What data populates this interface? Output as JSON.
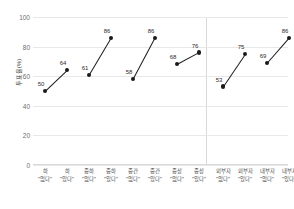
{
  "chart_data": {
    "type": "line",
    "title": "",
    "xlabel": "",
    "ylabel": "투표율(%)",
    "ylim": [
      0,
      100
    ],
    "yticks": [
      0,
      20,
      40,
      60,
      80,
      100
    ],
    "grid": true,
    "legend": "none",
    "categories": [
      "하 \"없다\"",
      "하 \"있다\"",
      "중하 \"없다\"",
      "중하 \"있다\"",
      "중간 \"없다\"",
      "중간 \"있다\"",
      "중상 \"없다\"",
      "중상 \"있다\"",
      "외부자 \"없다\"",
      "외부자 \"있다\"",
      "내부자 \"없다\"",
      "내부자 \"있다\""
    ],
    "category_lines": [
      [
        "하",
        "\"없다\""
      ],
      [
        "하",
        "\"있다\""
      ],
      [
        "중하",
        "\"없다\""
      ],
      [
        "중하",
        "\"있다\""
      ],
      [
        "중간",
        "\"없다\""
      ],
      [
        "중간",
        "\"있다\""
      ],
      [
        "중상",
        "\"없다\""
      ],
      [
        "중상",
        "\"있다\""
      ],
      [
        "외부자",
        "\"없다\""
      ],
      [
        "외부자",
        "\"있다\""
      ],
      [
        "내부자",
        "\"없다\""
      ],
      [
        "내부자",
        "\"있다\""
      ]
    ],
    "values": [
      50,
      64,
      61,
      86,
      58,
      86,
      68,
      76,
      53,
      75,
      69,
      86
    ],
    "point_labels": [
      "50",
      "64",
      "61",
      "86",
      "58",
      "86",
      "68",
      "76",
      "53",
      "75",
      "69",
      "86"
    ],
    "pairs": [
      {
        "name": "하",
        "no": 50,
        "yes": 64
      },
      {
        "name": "중하",
        "no": 61,
        "yes": 86
      },
      {
        "name": "중간",
        "no": 58,
        "yes": 86
      },
      {
        "name": "중상",
        "no": 68,
        "yes": 76
      },
      {
        "name": "외부자",
        "no": 53,
        "yes": 75
      },
      {
        "name": "내부자",
        "no": 69,
        "yes": 86
      }
    ],
    "panels": [
      {
        "pair_indices": [
          0,
          1,
          2,
          3
        ]
      },
      {
        "pair_indices": [
          4,
          5
        ]
      }
    ],
    "marker_color": "#1a1a1a",
    "line_color": "#1a1a1a",
    "grid_color": "#e8e8e8"
  }
}
